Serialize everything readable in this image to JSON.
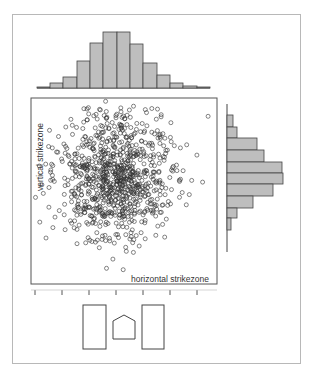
{
  "chart_data": {
    "type": "scatter",
    "title": "",
    "xlabel": "horizontal strikezone",
    "ylabel": "vertical strikezone",
    "grid": false,
    "legend": null,
    "x_ticks_count": 7,
    "scatter": {
      "n_points": 900,
      "center_x": 115,
      "center_y": 176,
      "sd_x": 28,
      "sd_y": 32,
      "seed": 7,
      "marker": "open-circle",
      "color": "#333333"
    },
    "top_histogram": {
      "type": "bar",
      "orientation": "vertical",
      "bins_px": [
        37,
        50,
        63,
        77,
        90,
        103,
        117,
        130,
        143,
        157,
        170,
        183,
        197,
        210
      ],
      "relative_counts": [
        1,
        5,
        11,
        27,
        45,
        56,
        56,
        44,
        25,
        13,
        5,
        2,
        1
      ],
      "fill": "#bebebe"
    },
    "right_histogram": {
      "type": "bar",
      "orientation": "horizontal",
      "bins_px": [
        115,
        127,
        138,
        150,
        162,
        173,
        184,
        196,
        208,
        218,
        230
      ],
      "relative_counts": [
        6,
        10,
        30,
        37,
        55,
        56,
        46,
        26,
        10,
        4
      ],
      "fill": "#bebebe"
    },
    "strikezone_diagram": {
      "left_box": "batter box",
      "center": "home plate",
      "right_box": "batter box"
    }
  },
  "labels": {
    "x_axis": "horizontal strikezone",
    "y_axis": "vertical strikezone"
  }
}
